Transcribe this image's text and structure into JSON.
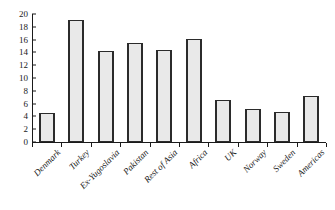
{
  "chart_data": {
    "type": "bar",
    "title": "",
    "subtitle": "",
    "xlabel": "",
    "ylabel": "",
    "ylim": [
      0,
      20
    ],
    "yticks": [
      0,
      2,
      4,
      6,
      8,
      10,
      12,
      14,
      16,
      18,
      20
    ],
    "grid": false,
    "legend": false,
    "legend_position": "none",
    "categories": [
      "Denmark",
      "Turkey",
      "Ex-Yugoslavia",
      "Pakistan",
      "Rest of Asia",
      "Africa",
      "UK",
      "Norway",
      "Sweden",
      "Americas"
    ],
    "values": [
      4.6,
      19.0,
      14.2,
      15.4,
      14.3,
      16.1,
      6.5,
      5.1,
      4.7,
      7.2
    ],
    "bar_fill_color": "#e9e9e9",
    "bar_edge_color": "#2b2b2b",
    "axis_color": "#1a1a1a"
  }
}
